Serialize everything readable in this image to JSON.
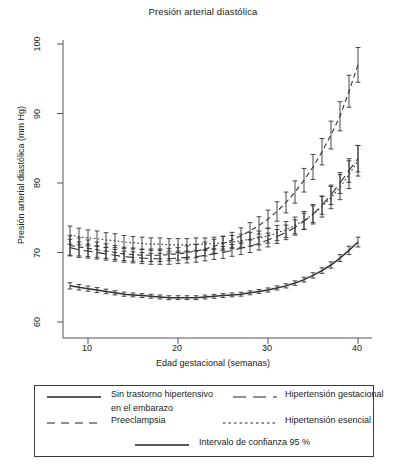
{
  "chart_data": {
    "type": "line",
    "title": "Presión arterial diastólica",
    "xlabel": "Edad gestacional (semanas)",
    "ylabel": "Presión arterial diastólica (mm Hg)",
    "xlim": [
      7,
      41
    ],
    "ylim": [
      57,
      101
    ],
    "xticks": [
      10,
      20,
      30,
      40
    ],
    "yticks": [
      60,
      70,
      80,
      90,
      100
    ],
    "grid": false,
    "legend_position": "below-plot",
    "errorbars": "Intervalo de confianza 95 %",
    "x": [
      8,
      9,
      10,
      11,
      12,
      13,
      14,
      15,
      16,
      17,
      18,
      19,
      20,
      21,
      22,
      23,
      24,
      25,
      26,
      27,
      28,
      29,
      30,
      31,
      32,
      33,
      34,
      35,
      36,
      37,
      38,
      39,
      40
    ],
    "series": [
      {
        "name": "Sin trastorno hipertensivo en el embarazo",
        "style": "solid",
        "values": [
          65.2,
          65.0,
          64.8,
          64.6,
          64.4,
          64.2,
          64.0,
          63.9,
          63.8,
          63.7,
          63.6,
          63.5,
          63.5,
          63.5,
          63.5,
          63.6,
          63.7,
          63.8,
          63.9,
          64.0,
          64.2,
          64.4,
          64.6,
          64.9,
          65.2,
          65.6,
          66.1,
          66.7,
          67.4,
          68.2,
          69.2,
          70.3,
          71.5
        ],
        "ci_half": [
          0.45,
          0.4,
          0.38,
          0.35,
          0.33,
          0.3,
          0.3,
          0.28,
          0.28,
          0.28,
          0.28,
          0.28,
          0.28,
          0.28,
          0.28,
          0.28,
          0.28,
          0.28,
          0.28,
          0.28,
          0.28,
          0.28,
          0.3,
          0.3,
          0.3,
          0.32,
          0.35,
          0.38,
          0.4,
          0.45,
          0.5,
          0.6,
          0.7
        ]
      },
      {
        "name": "Hipertensión gestacional",
        "style": "longdash",
        "values": [
          70.7,
          70.4,
          70.2,
          70.0,
          69.8,
          69.6,
          69.4,
          69.3,
          69.2,
          69.1,
          69.1,
          69.1,
          69.2,
          69.3,
          69.4,
          69.6,
          69.8,
          70.0,
          70.3,
          70.6,
          70.9,
          71.3,
          71.8,
          72.3,
          72.9,
          73.6,
          74.5,
          75.5,
          76.8,
          78.3,
          80.0,
          81.8,
          83.5
        ],
        "ci_half": [
          1.2,
          1.1,
          1.0,
          0.95,
          0.9,
          0.85,
          0.8,
          0.8,
          0.8,
          0.8,
          0.8,
          0.8,
          0.8,
          0.8,
          0.8,
          0.8,
          0.8,
          0.85,
          0.85,
          0.9,
          0.9,
          0.95,
          1.0,
          1.0,
          1.05,
          1.1,
          1.15,
          1.2,
          1.3,
          1.4,
          1.5,
          1.7,
          1.9
        ]
      },
      {
        "name": "Preeclampsia",
        "style": "dashed",
        "values": [
          71.0,
          70.8,
          70.6,
          70.4,
          70.2,
          70.0,
          69.8,
          69.7,
          69.6,
          69.6,
          69.6,
          69.7,
          69.8,
          70.0,
          70.2,
          70.5,
          70.9,
          71.3,
          71.8,
          72.4,
          73.1,
          73.9,
          74.8,
          75.9,
          77.2,
          78.7,
          80.4,
          82.3,
          84.5,
          86.9,
          89.6,
          93.2,
          97.0
        ],
        "ci_half": [
          1.4,
          1.3,
          1.2,
          1.1,
          1.05,
          1.0,
          0.95,
          0.95,
          0.9,
          0.9,
          0.9,
          0.9,
          0.9,
          0.95,
          0.95,
          1.0,
          1.0,
          1.05,
          1.1,
          1.15,
          1.2,
          1.25,
          1.3,
          1.4,
          1.5,
          1.6,
          1.7,
          1.8,
          1.9,
          2.0,
          2.1,
          2.3,
          2.5
        ]
      },
      {
        "name": "Hipertensión esencial",
        "style": "dotted",
        "values": [
          72.5,
          72.3,
          72.1,
          72.0,
          71.8,
          71.7,
          71.5,
          71.4,
          71.3,
          71.2,
          71.2,
          71.1,
          71.1,
          71.1,
          71.2,
          71.2,
          71.3,
          71.4,
          71.5,
          71.7,
          71.9,
          72.1,
          72.4,
          72.8,
          73.3,
          73.9,
          74.6,
          75.5,
          76.6,
          77.9,
          79.4,
          81.2,
          83.2
        ],
        "ci_half": [
          1.3,
          1.2,
          1.15,
          1.1,
          1.05,
          1.0,
          0.95,
          0.9,
          0.9,
          0.9,
          0.9,
          0.9,
          0.9,
          0.9,
          0.9,
          0.9,
          0.9,
          0.9,
          0.95,
          0.95,
          1.0,
          1.0,
          1.05,
          1.1,
          1.15,
          1.2,
          1.3,
          1.4,
          1.5,
          1.6,
          1.8,
          2.0,
          2.2
        ]
      }
    ]
  },
  "legend": {
    "items": [
      {
        "label": "Sin trastorno hipertensivo",
        "style": "solid"
      },
      {
        "label": "en el embarazo",
        "style": "none"
      },
      {
        "label": "Hipertensión gestacional",
        "style": "longdash"
      },
      {
        "label": "Preeclampsia",
        "style": "dashed"
      },
      {
        "label": "Hipertensión esencial",
        "style": "dotted"
      },
      {
        "label": "Intervalo de confianza 95 %",
        "style": "solid"
      }
    ]
  },
  "axis": {
    "yticks": [
      "60",
      "70",
      "80",
      "90",
      "100"
    ],
    "xticks": [
      "10",
      "20",
      "30",
      "40"
    ]
  },
  "colors": {
    "line": "#333333",
    "axis": "#555555",
    "text": "#1a1a1a"
  }
}
